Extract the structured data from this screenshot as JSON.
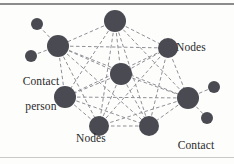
{
  "figure": {
    "background_color": "#fdfdfc",
    "node_color": "#4a4a52",
    "edge_color": "#8f8f96",
    "text_color": "#2a2a2a",
    "top_rule_color": "#8b8b8b",
    "bottom_rule_color": "#c9c9c9"
  },
  "labels": {
    "nodes_right": "Nodes",
    "nodes_bottom": "Nodes",
    "contact_person_left_line1": "Contact",
    "contact_person_left_line2": "person",
    "contact_person_right_line1": "Contact",
    "contact_person_right_line2": "person"
  },
  "chart_data": {
    "type": "scatter",
    "xlabel": "",
    "ylabel": "",
    "nodes": [
      {
        "id": "n-top",
        "role": "node",
        "x": 115,
        "y": 21,
        "r": 11
      },
      {
        "id": "n-upper-left",
        "role": "node",
        "x": 58,
        "y": 46,
        "r": 11
      },
      {
        "id": "n-center",
        "role": "node",
        "x": 121,
        "y": 74,
        "r": 11
      },
      {
        "id": "n-upper-right",
        "role": "node",
        "x": 168,
        "y": 48,
        "r": 10
      },
      {
        "id": "n-left-lower",
        "role": "node",
        "x": 65,
        "y": 97,
        "r": 11
      },
      {
        "id": "n-right",
        "role": "node",
        "x": 188,
        "y": 98,
        "r": 11
      },
      {
        "id": "n-bottom-left",
        "role": "node",
        "x": 99,
        "y": 126,
        "r": 10
      },
      {
        "id": "n-bottom-right",
        "role": "node",
        "x": 149,
        "y": 126,
        "r": 10
      },
      {
        "id": "c-left-top",
        "role": "contact-person",
        "x": 37,
        "y": 24,
        "r": 6
      },
      {
        "id": "c-left-bottom",
        "role": "contact-person",
        "x": 31,
        "y": 56,
        "r": 6
      },
      {
        "id": "c-right-top",
        "role": "contact-person",
        "x": 214,
        "y": 87,
        "r": 6
      },
      {
        "id": "c-right-bottom",
        "role": "contact-person",
        "x": 207,
        "y": 118,
        "r": 6
      }
    ],
    "edges": [
      [
        "n-top",
        "n-upper-left"
      ],
      [
        "n-top",
        "n-center"
      ],
      [
        "n-top",
        "n-upper-right"
      ],
      [
        "n-top",
        "n-left-lower"
      ],
      [
        "n-top",
        "n-right"
      ],
      [
        "n-top",
        "n-bottom-left"
      ],
      [
        "n-top",
        "n-bottom-right"
      ],
      [
        "n-upper-left",
        "n-center"
      ],
      [
        "n-upper-left",
        "n-upper-right"
      ],
      [
        "n-upper-left",
        "n-left-lower"
      ],
      [
        "n-upper-left",
        "n-right"
      ],
      [
        "n-upper-left",
        "n-bottom-left"
      ],
      [
        "n-upper-left",
        "n-bottom-right"
      ],
      [
        "n-center",
        "n-upper-right"
      ],
      [
        "n-center",
        "n-left-lower"
      ],
      [
        "n-center",
        "n-right"
      ],
      [
        "n-center",
        "n-bottom-left"
      ],
      [
        "n-center",
        "n-bottom-right"
      ],
      [
        "n-upper-right",
        "n-left-lower"
      ],
      [
        "n-upper-right",
        "n-right"
      ],
      [
        "n-upper-right",
        "n-bottom-left"
      ],
      [
        "n-upper-right",
        "n-bottom-right"
      ],
      [
        "n-left-lower",
        "n-right"
      ],
      [
        "n-left-lower",
        "n-bottom-left"
      ],
      [
        "n-left-lower",
        "n-bottom-right"
      ],
      [
        "n-right",
        "n-bottom-left"
      ],
      [
        "n-right",
        "n-bottom-right"
      ],
      [
        "n-bottom-left",
        "n-bottom-right"
      ],
      [
        "n-upper-left",
        "c-left-top"
      ],
      [
        "n-upper-left",
        "c-left-bottom"
      ],
      [
        "n-right",
        "c-right-top"
      ],
      [
        "n-right",
        "c-right-bottom"
      ]
    ]
  }
}
